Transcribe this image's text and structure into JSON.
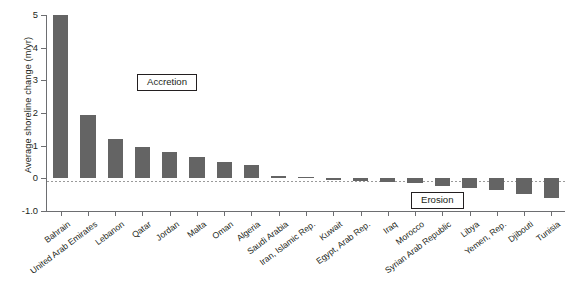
{
  "chart_data": {
    "type": "bar",
    "title": "",
    "xlabel": "",
    "ylabel": "Average shoreline change (m/yr)",
    "ylim": [
      -1.0,
      5.0
    ],
    "grid": false,
    "legend": "none",
    "zero_reference_line": true,
    "ytick_labels": [
      "5",
      "4",
      "3",
      "2",
      "1",
      "0",
      "-1.0"
    ],
    "ytick_values": [
      5,
      4,
      3,
      2,
      1,
      0,
      -1.0
    ],
    "bar_color": "#646464",
    "categories": [
      "Bahrain",
      "United Arab Emirates",
      "Lebanon",
      "Qatar",
      "Jordan",
      "Malta",
      "Oman",
      "Algeria",
      "Saudi Arabia",
      "Iran, Islamic Rep.",
      "Kuwait",
      "Egypt, Arab Rep.",
      "Iraq",
      "Morocco",
      "Syrian Arab Republic",
      "Libya",
      "Yemen, Rep.",
      "Djibouti",
      "Tunisia"
    ],
    "values": [
      5.0,
      1.95,
      1.2,
      0.95,
      0.82,
      0.65,
      0.5,
      0.42,
      0.07,
      0.05,
      -0.05,
      -0.08,
      -0.12,
      -0.15,
      -0.22,
      -0.3,
      -0.35,
      -0.48,
      -0.6
    ],
    "annotations": [
      {
        "text": "Accretion",
        "region": "positive"
      },
      {
        "text": "Erosion",
        "region": "negative"
      }
    ]
  }
}
